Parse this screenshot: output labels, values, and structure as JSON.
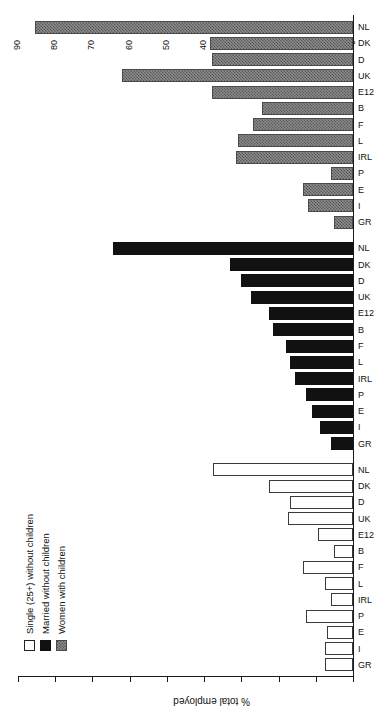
{
  "chart_data": {
    "type": "bar",
    "orientation": "horizontal",
    "title": "",
    "xlabel": "",
    "ylabel": "% total employed",
    "ylim": [
      0,
      90
    ],
    "yticks": [
      0,
      10,
      20,
      30,
      40,
      50,
      60,
      70,
      80,
      90
    ],
    "grid": false,
    "legend_position": "top-left",
    "categories": [
      "GR",
      "I",
      "E",
      "P",
      "IRL",
      "L",
      "F",
      "B",
      "E12",
      "UK",
      "D",
      "DK",
      "NL"
    ],
    "groups": [
      {
        "name": "Single (25+) without children",
        "fill": "white",
        "categories": [
          "GR",
          "I",
          "E",
          "P",
          "IRL",
          "L",
          "F",
          "B",
          "E12",
          "UK",
          "D",
          "DK",
          "NL"
        ],
        "values": [
          7.5,
          7.5,
          7.0,
          12.5,
          6.0,
          7.5,
          13.5,
          5.0,
          9.5,
          17.5,
          17.0,
          22.5,
          37.5
        ]
      },
      {
        "name": "Married without children",
        "fill": "black",
        "categories": [
          "GR",
          "I",
          "E",
          "P",
          "IRL",
          "L",
          "F",
          "B",
          "E12",
          "UK",
          "D",
          "DK",
          "NL"
        ],
        "values": [
          6.0,
          9.0,
          11.0,
          12.5,
          15.5,
          17.0,
          18.0,
          21.5,
          22.5,
          27.5,
          30.0,
          33.0,
          64.5
        ]
      },
      {
        "name": "Women with children",
        "fill": "hatched",
        "categories": [
          "GR",
          "I",
          "E",
          "P",
          "IRL",
          "L",
          "F",
          "B",
          "E12",
          "UK",
          "D",
          "DK",
          "NL"
        ],
        "values": [
          5.0,
          12.0,
          13.5,
          6.0,
          31.5,
          31.0,
          27.0,
          24.5,
          38.0,
          62.0,
          38.0,
          38.5,
          85.5
        ]
      }
    ],
    "legend": [
      {
        "label": "Single (25+) without children",
        "fill": "white"
      },
      {
        "label": "Married without children",
        "fill": "black"
      },
      {
        "label": "Women with children",
        "fill": "hatched"
      }
    ],
    "tick_labels": [
      "0",
      "10",
      "20",
      "30",
      "40",
      "50",
      "60",
      "70",
      "80",
      "90"
    ],
    "category_label_sequence": [
      "GR",
      "I",
      "E",
      "P",
      "IRL",
      "L",
      "F",
      "B",
      "E12",
      "UK",
      "D",
      "DK",
      "NL",
      "GR",
      "I",
      "E",
      "P",
      "IRL",
      "L",
      "F",
      "B",
      "E12",
      "UK",
      "D",
      "DK",
      "NL",
      "GR",
      "I",
      "E",
      "P",
      "IRL",
      "L",
      "F",
      "B",
      "E12",
      "UK",
      "D",
      "DK",
      "NL"
    ]
  },
  "axis": {
    "value_axis_title": "% total employed"
  }
}
